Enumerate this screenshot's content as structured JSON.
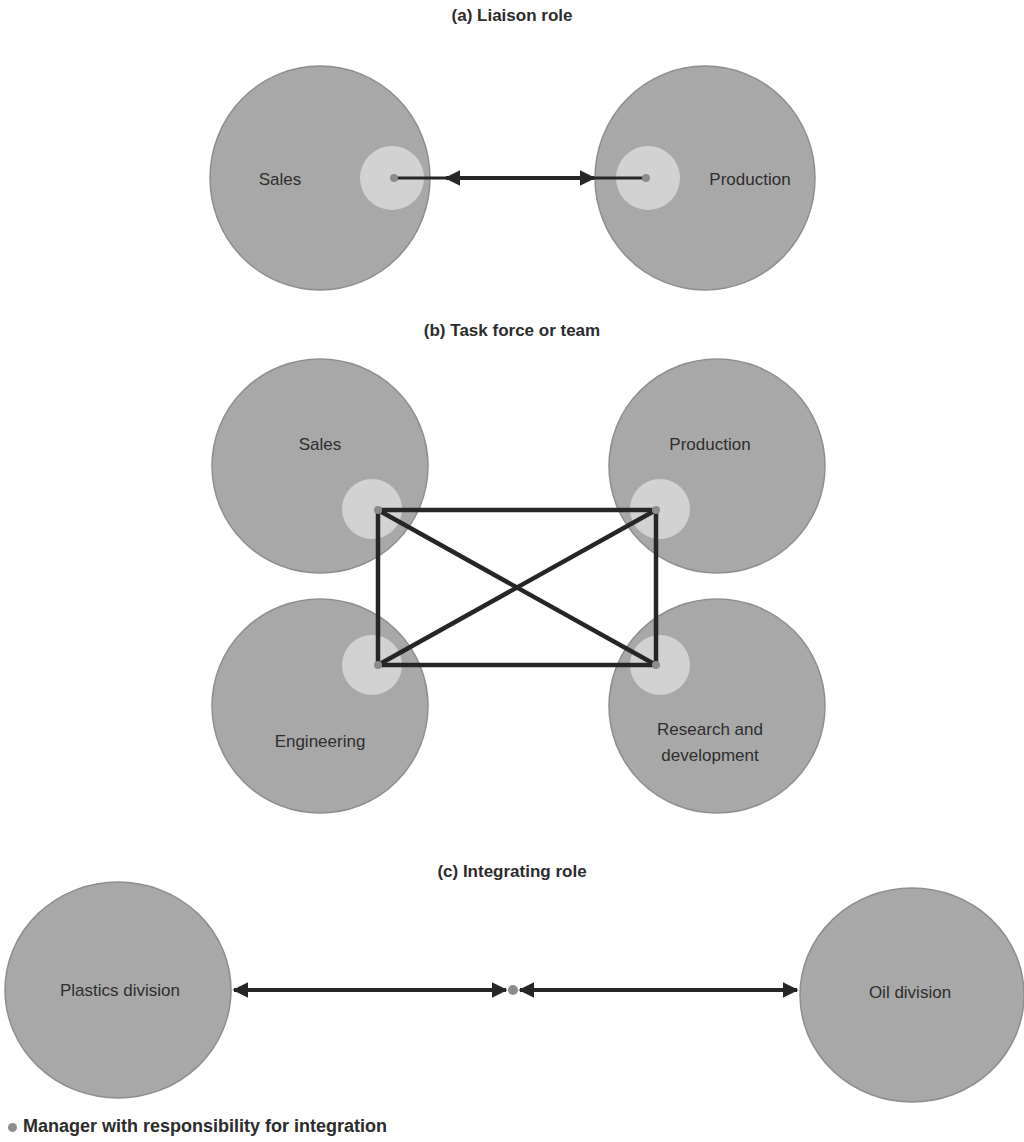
{
  "colors": {
    "department_fill": "#a8a8a8",
    "department_stroke": "#8e8e8e",
    "highlight_fill": "#d2d2d2",
    "manager_dot": "#8c8c8c",
    "line": "#262626"
  },
  "panels": {
    "a": {
      "title": "(a) Liaison role",
      "nodes": [
        {
          "label": "Sales"
        },
        {
          "label": "Production"
        }
      ]
    },
    "b": {
      "title": "(b) Task force or team",
      "nodes": [
        {
          "label": "Sales"
        },
        {
          "label": "Production"
        },
        {
          "label": "Engineering"
        },
        {
          "label_line1": "Research and",
          "label_line2": "development"
        }
      ]
    },
    "c": {
      "title": "(c) Integrating role",
      "nodes": [
        {
          "label": "Plastics division"
        },
        {
          "label": "Oil division"
        }
      ]
    }
  },
  "legend": {
    "marker": "manager-dot",
    "label": "Manager with responsibility for integration"
  }
}
